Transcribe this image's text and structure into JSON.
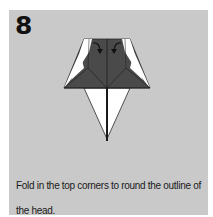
{
  "step": {
    "number": "8",
    "instruction": "Fold in the top corners to round the outline of the head."
  },
  "colors": {
    "panel_bg": "#c9c9c9",
    "paper_dark": "#4a4a4a",
    "paper_white": "#ffffff",
    "line": "#1a1a1a"
  },
  "diagram": {
    "arrows": [
      "fold-arrow-left",
      "fold-arrow-right"
    ]
  }
}
